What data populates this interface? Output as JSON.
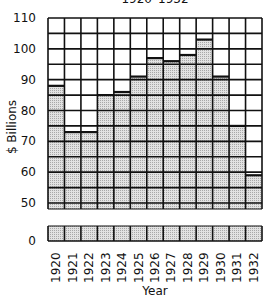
{
  "chart_data": {
    "type": "bar",
    "title": "1920–1932",
    "xlabel": "Year",
    "ylabel": "$ Billions",
    "categories": [
      "1920",
      "1921",
      "1922",
      "1923",
      "1924",
      "1925",
      "1926",
      "1927",
      "1928",
      "1929",
      "1930",
      "1931",
      "1932"
    ],
    "values": [
      88,
      73,
      73,
      85,
      86,
      91,
      97,
      96,
      98,
      103,
      91,
      75,
      59
    ],
    "ylim": [
      0,
      110
    ],
    "y_ticks": [
      0,
      50,
      60,
      70,
      80,
      90,
      100,
      110
    ],
    "axis_break": "between 0 and 50",
    "grid": true,
    "grid_step": 5,
    "colors": {
      "bar_fill": "#d8d8d8",
      "grid": "#111111",
      "background": "#ffffff"
    }
  }
}
